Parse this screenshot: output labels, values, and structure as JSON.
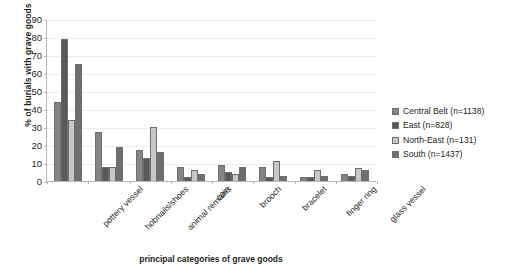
{
  "chart_data": {
    "type": "bar",
    "title": "",
    "xlabel": "principal categories of grave goods",
    "ylabel": "% of burials with grave goods",
    "ylim": [
      0,
      90
    ],
    "yticks": [
      0,
      10,
      20,
      30,
      40,
      50,
      60,
      70,
      80,
      90
    ],
    "grid": true,
    "legend_position": "right",
    "categories": [
      "pottery vessel",
      "hobnails/shoes",
      "animal remains",
      "coin",
      "brooch",
      "bracelet",
      "finger ring",
      "glass vessel"
    ],
    "series": [
      {
        "name": "Central Belt (n=1138)",
        "color": "#848588",
        "values": [
          44,
          27,
          17,
          8,
          9,
          8,
          2,
          4
        ]
      },
      {
        "name": "East  (n=828)",
        "color": "#59595c",
        "values": [
          79,
          8,
          13,
          2,
          5,
          2,
          2,
          3
        ]
      },
      {
        "name": "North-East (n=131)",
        "color": "#c6c7c9",
        "values": [
          34,
          8,
          30,
          6,
          4,
          11,
          6,
          7
        ]
      },
      {
        "name": "South (n=1437)",
        "color": "#6d6e70",
        "values": [
          65,
          19,
          16,
          4,
          8,
          3,
          3,
          6
        ]
      }
    ]
  },
  "legend": {
    "items": [
      {
        "label": "Central Belt (n=1138)",
        "swatch": "#848588"
      },
      {
        "label": "East  (n=828)",
        "swatch": "#59595c"
      },
      {
        "label": "North-East (n=131)",
        "swatch": "#c6c7c9"
      },
      {
        "label": "South (n=1437)",
        "swatch": "#6d6e70"
      }
    ]
  },
  "axes": {
    "y_title": "% of burials with grave goods",
    "x_title": "principal categories of grave goods",
    "y_tick_labels": [
      "0",
      "10",
      "20",
      "30",
      "40",
      "50",
      "60",
      "70",
      "80",
      "90"
    ]
  },
  "colors": {
    "axis": "#b8b8b8",
    "grid": "#eceded",
    "text": "#231f20",
    "background": "#ffffff"
  }
}
